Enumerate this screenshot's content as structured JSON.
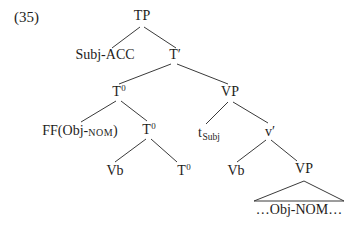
{
  "figure": {
    "number": "(35)"
  },
  "tree": {
    "nodes": {
      "tp": {
        "label": "TP"
      },
      "subj_acc": {
        "label": "Subj-ACC"
      },
      "t_bar": {
        "label": "T′"
      },
      "t0_upper": {
        "base": "T",
        "sup": "0"
      },
      "vp_upper": {
        "label": "VP"
      },
      "ff_obj": {
        "pre": "FF(Obj-",
        "smallcaps": "NOM",
        "post": ")"
      },
      "t0_mid": {
        "base": "T",
        "sup": "0"
      },
      "t_subj_trace": {
        "base": "t",
        "sub": "Subj"
      },
      "v_bar": {
        "label": "v′"
      },
      "vb_left": {
        "label": "Vb"
      },
      "t0_lower": {
        "base": "T",
        "sup": "0"
      },
      "vb_right": {
        "label": "Vb"
      },
      "vp_lower": {
        "label": "VP"
      },
      "obj_phrase": {
        "label": "…Obj-NOM…"
      }
    }
  },
  "colors": {
    "text": "#1e1d1b",
    "line": "#3a3a3a",
    "background": "#ffffff"
  }
}
